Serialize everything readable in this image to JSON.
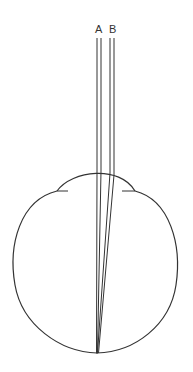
{
  "diagram": {
    "title": "",
    "labels": {
      "a": "A",
      "b": "B"
    },
    "colors": {
      "stroke": "#333333",
      "background": "#ffffff"
    },
    "elements": [
      "eye-globe-outline",
      "cornea-bulge",
      "ray-pair-A",
      "ray-pair-B",
      "focal-point"
    ]
  }
}
